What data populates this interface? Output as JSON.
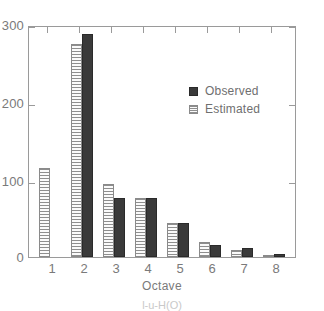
{
  "chart_data": {
    "type": "bar",
    "title": "",
    "xlabel": "Octave",
    "ylabel": "",
    "categories": [
      "1",
      "2",
      "3",
      "4",
      "5",
      "6",
      "7",
      "8"
    ],
    "series": [
      {
        "name": "Observed",
        "values": [
          0,
          288,
          76,
          76,
          44,
          15,
          12,
          4
        ]
      },
      {
        "name": "Estimated",
        "values": [
          115,
          275,
          95,
          76,
          44,
          20,
          9,
          3
        ]
      }
    ],
    "ylim": [
      0,
      300
    ],
    "yticks": [
      0,
      100,
      200,
      300
    ],
    "ytick_labels": [
      "0",
      "100",
      "200",
      "300"
    ],
    "grid": false,
    "legend_position": "upper-right-inside",
    "colors": {
      "observed": "#3a3a3a",
      "estimated": "#f2f2f2",
      "axis": "#9a9a9a",
      "text": "#7a7a7a"
    }
  },
  "axis": {
    "x_title": "Octave"
  },
  "legend": {
    "entries": [
      {
        "label": "Observed"
      },
      {
        "label": "Estimated"
      }
    ]
  },
  "caption": {
    "text": "l-u-H(O)"
  }
}
